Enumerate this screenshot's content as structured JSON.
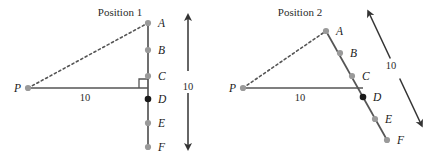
{
  "figure": {
    "width": 432,
    "height": 160,
    "background": "#ffffff",
    "colors": {
      "line": "#555555",
      "dot_gray": "#9a9a9a",
      "dot_black": "#1a1a1a",
      "text": "#2b2b2b",
      "arrow": "#333333"
    }
  },
  "panels": [
    {
      "id": "position-1",
      "title": "Position 1",
      "title_pos": {
        "x": 120,
        "y": 16
      },
      "pivot": {
        "label": "P",
        "x": 28,
        "y": 88,
        "label_x": 14,
        "label_y": 92
      },
      "points": [
        {
          "label": "A",
          "x": 148,
          "y": 23,
          "label_x": 158,
          "label_y": 27,
          "fill": "gray"
        },
        {
          "label": "B",
          "x": 148,
          "y": 50,
          "label_x": 158,
          "label_y": 54,
          "fill": "gray"
        },
        {
          "label": "C",
          "x": 148,
          "y": 76,
          "label_x": 158,
          "label_y": 80,
          "fill": "gray"
        },
        {
          "label": "D",
          "x": 148,
          "y": 99,
          "label_x": 158,
          "label_y": 103,
          "fill": "black"
        },
        {
          "label": "E",
          "x": 148,
          "y": 123,
          "label_x": 158,
          "label_y": 127,
          "fill": "gray"
        },
        {
          "label": "F",
          "x": 148,
          "y": 147,
          "label_x": 158,
          "label_y": 151,
          "fill": "gray"
        }
      ],
      "rod": {
        "x1": 148,
        "y1": 23,
        "x2": 148,
        "y2": 147
      },
      "dashed_segment": {
        "x1": 28,
        "y1": 88,
        "x2": 148,
        "y2": 23
      },
      "solid_segment": {
        "x1": 28,
        "y1": 88,
        "x2": 148,
        "y2": 88
      },
      "right_angle": {
        "x": 148,
        "y": 88,
        "size": 9,
        "dx": -1,
        "dy": -1
      },
      "distance_label": {
        "text": "10",
        "x": 85,
        "y": 101
      },
      "scale_arrow": {
        "x1": 188,
        "y1": 17,
        "x2": 188,
        "y2": 147,
        "label": "10",
        "label_x": 188,
        "label_y": 86
      }
    },
    {
      "id": "position-2",
      "title": "Position 2",
      "title_pos": {
        "x": 300,
        "y": 16
      },
      "pivot": {
        "label": "P",
        "x": 243,
        "y": 88,
        "label_x": 229,
        "label_y": 92
      },
      "points": [
        {
          "label": "A",
          "x": 326,
          "y": 31,
          "label_x": 336,
          "label_y": 35,
          "fill": "gray"
        },
        {
          "label": "B",
          "x": 340,
          "y": 53,
          "label_x": 350,
          "label_y": 57,
          "fill": "gray"
        },
        {
          "label": "C",
          "x": 352,
          "y": 76,
          "label_x": 362,
          "label_y": 80,
          "fill": "gray"
        },
        {
          "label": "D",
          "x": 363,
          "y": 97,
          "label_x": 373,
          "label_y": 101,
          "fill": "black"
        },
        {
          "label": "E",
          "x": 375,
          "y": 119,
          "label_x": 385,
          "label_y": 123,
          "fill": "gray"
        },
        {
          "label": "F",
          "x": 387,
          "y": 140,
          "label_x": 397,
          "label_y": 144,
          "fill": "gray"
        }
      ],
      "rod": {
        "x1": 326,
        "y1": 31,
        "x2": 387,
        "y2": 140
      },
      "dashed_segment": {
        "x1": 243,
        "y1": 88,
        "x2": 326,
        "y2": 31
      },
      "solid_segment": {
        "x1": 243,
        "y1": 88,
        "x2": 363,
        "y2": 88
      },
      "right_angle": null,
      "distance_label": {
        "text": "10",
        "x": 300,
        "y": 101
      },
      "scale_arrow": {
        "x1": 369,
        "y1": 13,
        "x2": 421,
        "y2": 124,
        "label": "10",
        "label_x": 391,
        "label_y": 65
      }
    }
  ],
  "legend": {
    "pivot_name": "P",
    "rod_points": [
      "A",
      "B",
      "C",
      "D",
      "E",
      "F"
    ],
    "measurements": [
      "10",
      "10",
      "10",
      "10"
    ]
  }
}
